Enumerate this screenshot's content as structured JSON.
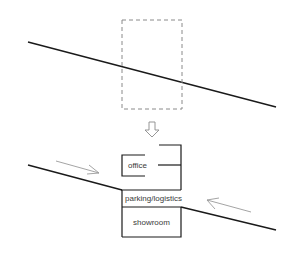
{
  "diagram": {
    "colors": {
      "road": "#1a1a1a",
      "building": "#1a1a1a",
      "dashed_site": "#8a8a8a",
      "flow_arrow": "#9a9a9a",
      "transform_arrow": "#8a8a8a"
    },
    "top_panel": {
      "description": "site on sloped terrain",
      "road_line": {
        "x1": 28,
        "y1": 42,
        "x2": 276,
        "y2": 107
      },
      "site_boundary": {
        "x": 122,
        "y": 20,
        "width": 60,
        "height": 89,
        "style": "dashed"
      }
    },
    "transform_arrow": {
      "direction": "down",
      "x": 152,
      "y": 122
    },
    "bottom_panel": {
      "labels": {
        "office": "office",
        "parking": "parking/logistics",
        "showroom": "showroom"
      },
      "flow_arrows": [
        {
          "from": [
            56,
            161
          ],
          "to": [
            99,
            173
          ],
          "direction": "right"
        },
        {
          "from": [
            251,
            212
          ],
          "to": [
            207,
            200
          ],
          "direction": "left"
        }
      ]
    }
  }
}
